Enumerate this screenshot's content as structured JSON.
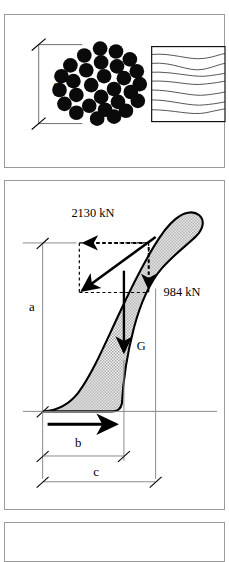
{
  "figure": {
    "type": "engineering-diagram",
    "panels": [
      {
        "id": "cable-cross-section",
        "name": "Cable cross section and longitudinal view",
        "dimension_label": "d",
        "strand_count": 28,
        "views": [
          "cross-section",
          "longitudinal-grain"
        ]
      },
      {
        "id": "force-diagram",
        "name": "Structure force diagram",
        "forces": [
          {
            "label": "2130 kN",
            "direction": "horizontal-left",
            "style": "dashed"
          },
          {
            "label": "984 kN",
            "direction": "vertical-down",
            "style": "dashed"
          },
          {
            "label": "G",
            "direction": "vertical-down",
            "style": "solid",
            "meaning": "self weight"
          }
        ],
        "dimensions": [
          {
            "label": "a",
            "orientation": "vertical"
          },
          {
            "label": "b",
            "orientation": "horizontal"
          },
          {
            "label": "c",
            "orientation": "horizontal"
          }
        ]
      }
    ],
    "colors": {
      "ink": "#000000",
      "panel_border": "#9a9a9a",
      "thin_line": "#808080",
      "fill_stipple": "#bfbfbf",
      "background": "#ffffff"
    }
  },
  "cable": {
    "dimension": "d"
  },
  "forces": {
    "horizontal": "2130 kN",
    "vertical": "984 kN",
    "weight": "G"
  },
  "dims": {
    "a": "a",
    "b": "b",
    "c": "c"
  }
}
